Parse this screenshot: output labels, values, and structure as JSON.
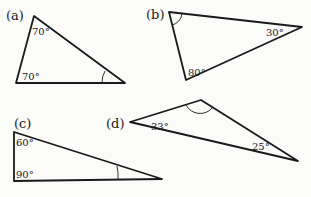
{
  "diagram": {
    "triangles": [
      {
        "id": "a",
        "label": "(a)",
        "vertices": [
          [
            34,
            16
          ],
          [
            16,
            83
          ],
          [
            125,
            83
          ]
        ],
        "angles": [
          {
            "vertex": 0,
            "text": "70°"
          },
          {
            "vertex": 1,
            "text": "70°"
          },
          {
            "vertex": 2,
            "text": "",
            "unknown": true
          }
        ]
      },
      {
        "id": "b",
        "label": "(b)",
        "vertices": [
          [
            169,
            12
          ],
          [
            186,
            80
          ],
          [
            302,
            27
          ]
        ],
        "angles": [
          {
            "vertex": 0,
            "text": "",
            "unknown": true
          },
          {
            "vertex": 1,
            "text": "80°"
          },
          {
            "vertex": 2,
            "text": "30°"
          }
        ]
      },
      {
        "id": "c",
        "label": "(c)",
        "vertices": [
          [
            14,
            132
          ],
          [
            14,
            181
          ],
          [
            162,
            179
          ]
        ],
        "angles": [
          {
            "vertex": 0,
            "text": "60°"
          },
          {
            "vertex": 1,
            "text": "90°"
          },
          {
            "vertex": 2,
            "text": "",
            "unknown": true
          }
        ]
      },
      {
        "id": "d",
        "label": "(d)",
        "vertices": [
          [
            130,
            122
          ],
          [
            201,
            100
          ],
          [
            298,
            161
          ]
        ],
        "angles": [
          {
            "vertex": 0,
            "text": "33°"
          },
          {
            "vertex": 1,
            "text": "",
            "unknown": true
          },
          {
            "vertex": 2,
            "text": "25°"
          }
        ]
      }
    ]
  },
  "labels": {
    "a": "(a)",
    "a_top": "70°",
    "a_bottom": "70°",
    "b": "(b)",
    "b_bottom": "80°",
    "b_right": "30°",
    "c": "(c)",
    "c_top": "60°",
    "c_bottom": "90°",
    "d": "(d)",
    "d_left": "33°",
    "d_right": "25°"
  }
}
